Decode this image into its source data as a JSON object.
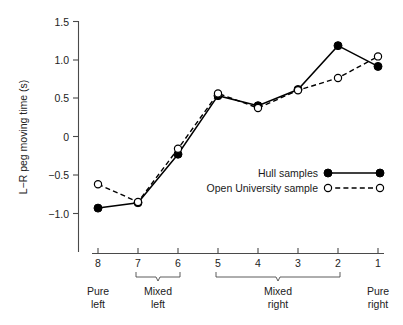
{
  "chart_data": {
    "type": "line",
    "title": "",
    "xlabel": "",
    "ylabel": "L−R peg moving time (s)",
    "categories": [
      "8",
      "7",
      "6",
      "5",
      "4",
      "3",
      "2",
      "1"
    ],
    "x": [
      8,
      7,
      6,
      5,
      4,
      3,
      2,
      1
    ],
    "ylim": [
      -1.25,
      1.5
    ],
    "xlim": [
      8.5,
      0.5
    ],
    "y_ticks": [
      1.5,
      1.0,
      0.5,
      0,
      -0.5,
      -1.0
    ],
    "y_tick_labels": [
      "1.5",
      "1.0",
      "0.5",
      "0",
      "−0.5",
      "−1.0"
    ],
    "x_tick_labels": [
      "8",
      "7",
      "6",
      "5",
      "4",
      "3",
      "2",
      "1"
    ],
    "grid": false,
    "legend_position": "center-right-lower",
    "series": [
      {
        "name": "Hull samples",
        "marker": "filled-circle",
        "line": "solid",
        "color": "#000000",
        "values": [
          -0.93,
          -0.86,
          -0.23,
          0.53,
          0.4,
          0.61,
          1.18,
          0.91
        ]
      },
      {
        "name": "Open University sample",
        "marker": "open-circle",
        "line": "dashed",
        "color": "#000000",
        "values": [
          -0.62,
          -0.85,
          -0.16,
          0.56,
          0.37,
          0.6,
          0.76,
          1.04
        ]
      }
    ],
    "x_groups": [
      {
        "label_line1": "Pure",
        "label_line2": "left",
        "from": 8,
        "to": 8,
        "bracket": false
      },
      {
        "label_line1": "Mixed",
        "label_line2": "left",
        "from": 7,
        "to": 6,
        "bracket": true
      },
      {
        "label_line1": "Mixed",
        "label_line2": "right",
        "from": 5,
        "to": 2,
        "bracket": true
      },
      {
        "label_line1": "Pure",
        "label_line2": "right",
        "from": 1,
        "to": 1,
        "bracket": false
      }
    ],
    "annotations": []
  },
  "legend": {
    "items": [
      {
        "label": "Hull samples",
        "marker": "filled-circle",
        "line": "solid"
      },
      {
        "label": "Open University sample",
        "marker": "open-circle",
        "line": "dashed"
      }
    ]
  },
  "axis": {
    "y_title": "L−R peg moving time (s)",
    "y_labels": [
      "1.5",
      "1.0",
      "0.5",
      "0",
      "−0.5",
      "−1.0"
    ],
    "x_labels": [
      "8",
      "7",
      "6",
      "5",
      "4",
      "3",
      "2",
      "1"
    ]
  },
  "groups": {
    "g0_line1": "Pure",
    "g0_line2": "left",
    "g1_line1": "Mixed",
    "g1_line2": "left",
    "g2_line1": "Mixed",
    "g2_line2": "right",
    "g3_line1": "Pure",
    "g3_line2": "right"
  }
}
